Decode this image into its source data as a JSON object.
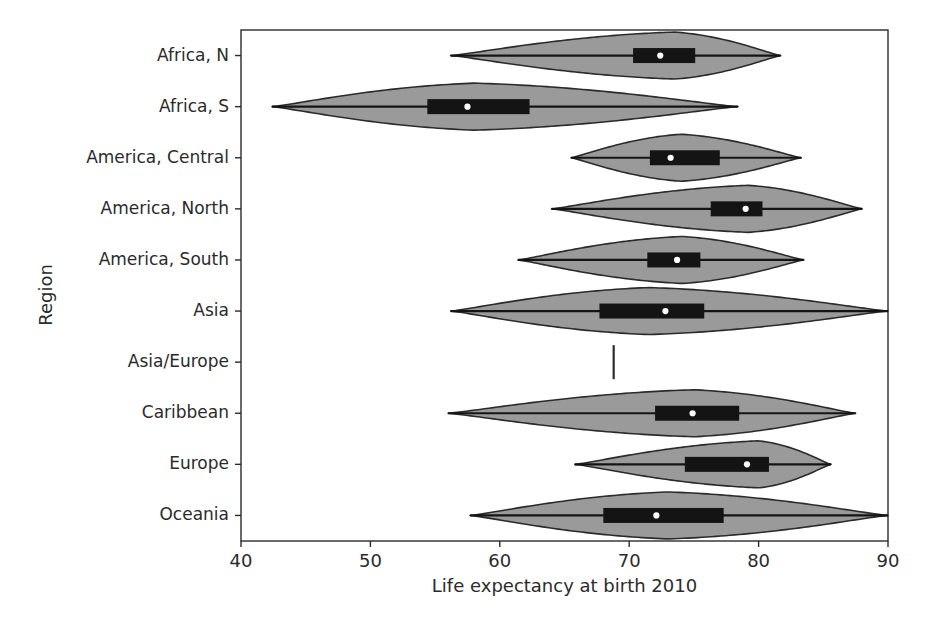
{
  "chart_data": {
    "type": "violin",
    "title": "",
    "xlabel": "Life expectancy at birth 2010",
    "ylabel": "Region",
    "xlim": [
      40,
      90
    ],
    "xticks": [
      40,
      50,
      60,
      70,
      80,
      90
    ],
    "xtick_labels": [
      "40",
      "50",
      "60",
      "70",
      "80",
      "90"
    ],
    "grid": false,
    "orientation": "horizontal",
    "legend": "none",
    "colors": {
      "violin_fill": "#9a9a9a",
      "violin_edge": "#2b2b2b",
      "box_fill": "#141414",
      "median_marker": "#ffffff",
      "background": "#ffffff",
      "text": "#2b2b2b"
    },
    "categories": [
      "Africa, N",
      "Africa, S",
      "America, Central",
      "America, North",
      "America, South",
      "Asia",
      "Asia/Europe",
      "Caribbean",
      "Europe",
      "Oceania"
    ],
    "series": [
      {
        "name": "Africa, N",
        "min": 56.2,
        "q1": 70.3,
        "median": 72.4,
        "q3": 75.1,
        "max": 81.7,
        "peak": 73.5,
        "bandwidth_shape": "right-skewed-peak",
        "single_value": false
      },
      {
        "name": "Africa, S",
        "min": 42.4,
        "q1": 54.4,
        "median": 57.5,
        "q3": 62.3,
        "max": 78.4,
        "peak": 58.0,
        "bandwidth_shape": "left-peak-long-right-tail",
        "single_value": false
      },
      {
        "name": "America, Central",
        "min": 65.5,
        "q1": 71.6,
        "median": 73.2,
        "q3": 77.0,
        "max": 83.3,
        "peak": 74.0,
        "bandwidth_shape": "symmetric",
        "single_value": false
      },
      {
        "name": "America, North",
        "min": 64.0,
        "q1": 76.3,
        "median": 79.0,
        "q3": 80.3,
        "max": 88.0,
        "peak": 79.2,
        "bandwidth_shape": "right-peak-long-left-tail",
        "single_value": false
      },
      {
        "name": "America, South",
        "min": 61.4,
        "q1": 71.4,
        "median": 73.7,
        "q3": 75.5,
        "max": 83.5,
        "peak": 74.1,
        "bandwidth_shape": "symmetric",
        "single_value": false
      },
      {
        "name": "Asia",
        "min": 56.2,
        "q1": 67.7,
        "median": 72.8,
        "q3": 75.8,
        "max": 90.0,
        "peak": 71.5,
        "bandwidth_shape": "broad-flat",
        "single_value": false
      },
      {
        "name": "Asia/Europe",
        "min": 68.8,
        "q1": 68.8,
        "median": 68.8,
        "q3": 68.8,
        "max": 68.8,
        "peak": 68.8,
        "bandwidth_shape": "single-observation",
        "single_value": true
      },
      {
        "name": "Caribbean",
        "min": 56.0,
        "q1": 72.0,
        "median": 74.9,
        "q3": 78.5,
        "max": 87.5,
        "peak": 75.0,
        "bandwidth_shape": "right-peak",
        "single_value": false
      },
      {
        "name": "Europe",
        "min": 65.8,
        "q1": 74.3,
        "median": 79.1,
        "q3": 80.8,
        "max": 85.6,
        "peak": 80.0,
        "bandwidth_shape": "right-peak-long-left-tail",
        "single_value": false
      },
      {
        "name": "Oceania",
        "min": 57.7,
        "q1": 68.0,
        "median": 72.1,
        "q3": 77.3,
        "max": 90.0,
        "peak": 73.0,
        "bandwidth_shape": "broad-flat",
        "single_value": false
      }
    ]
  }
}
